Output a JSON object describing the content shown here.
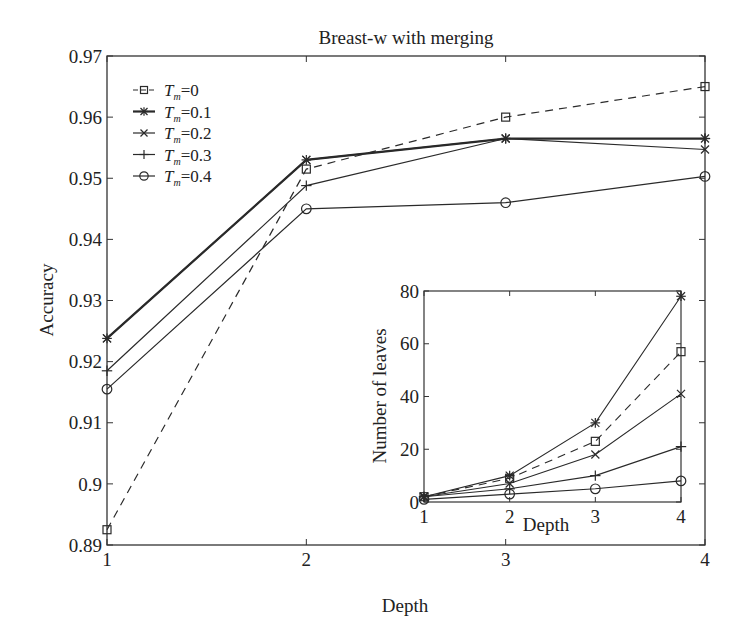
{
  "chart_data": [
    {
      "type": "line",
      "title": "Breast-w with merging",
      "xlabel": "Depth",
      "ylabel": "Accuracy",
      "x": [
        1,
        2,
        3,
        4
      ],
      "xticks": [
        "1",
        "2",
        "3",
        "4"
      ],
      "yticks": [
        "0.89",
        "0.9",
        "0.91",
        "0.92",
        "0.93",
        "0.94",
        "0.95",
        "0.96",
        "0.97"
      ],
      "xlim": [
        1,
        4
      ],
      "ylim": [
        0.89,
        0.97
      ],
      "grid": false,
      "legend_position": "upper left",
      "series": [
        {
          "name": "Tm=0",
          "label_sym": "T",
          "label_sub": "m",
          "label_val": "=0",
          "marker": "square",
          "dash": true,
          "bold": false,
          "values": [
            0.8925,
            0.9515,
            0.96,
            0.965
          ]
        },
        {
          "name": "Tm=0.1",
          "label_sym": "T",
          "label_sub": "m",
          "label_val": "=0.1",
          "marker": "asterisk",
          "dash": false,
          "bold": true,
          "values": [
            0.9238,
            0.953,
            0.9565,
            0.9565
          ]
        },
        {
          "name": "Tm=0.2",
          "label_sym": "T",
          "label_sub": "m",
          "label_val": "=0.2",
          "marker": "x",
          "dash": false,
          "bold": false,
          "values": [
            0.9238,
            0.953,
            0.9565,
            0.9547
          ]
        },
        {
          "name": "Tm=0.3",
          "label_sym": "T",
          "label_sub": "m",
          "label_val": "=0.3",
          "marker": "plus",
          "dash": false,
          "bold": false,
          "values": [
            0.9185,
            0.9488,
            0.9565,
            0.9565
          ]
        },
        {
          "name": "Tm=0.4",
          "label_sym": "T",
          "label_sub": "m",
          "label_val": "=0.4",
          "marker": "circle",
          "dash": false,
          "bold": false,
          "values": [
            0.9155,
            0.945,
            0.946,
            0.9503
          ]
        }
      ]
    },
    {
      "type": "line",
      "title": "",
      "xlabel": "Depth",
      "ylabel": "Number of leaves",
      "x": [
        1,
        2,
        3,
        4
      ],
      "xticks": [
        "1",
        "2",
        "3",
        "4"
      ],
      "yticks": [
        "0",
        "20",
        "40",
        "60",
        "80"
      ],
      "xlim": [
        1,
        4
      ],
      "ylim": [
        0,
        80
      ],
      "grid": false,
      "inset": true,
      "series": [
        {
          "name": "Tm=0",
          "marker": "square",
          "dash": true,
          "values": [
            2,
            9,
            23,
            57
          ]
        },
        {
          "name": "Tm=0.1",
          "marker": "asterisk",
          "dash": false,
          "values": [
            2,
            10,
            30,
            78
          ]
        },
        {
          "name": "Tm=0.2",
          "marker": "x",
          "dash": false,
          "values": [
            2,
            7,
            18,
            41
          ]
        },
        {
          "name": "Tm=0.3",
          "marker": "plus",
          "dash": false,
          "values": [
            2,
            5,
            10,
            21
          ]
        },
        {
          "name": "Tm=0.4",
          "marker": "circle",
          "dash": false,
          "values": [
            1,
            3,
            5,
            8
          ]
        }
      ]
    }
  ],
  "colors": {
    "line": "#2a2a2a",
    "axis": "#333333",
    "background": "#ffffff"
  }
}
